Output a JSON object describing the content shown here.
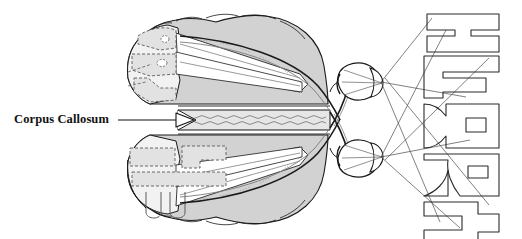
{
  "figure": {
    "title_label": "Corpus Callosum",
    "type": "anatomical-diagram"
  },
  "labels": {
    "corpus_callosum": "Corpus Callosum"
  },
  "stimulus": {
    "word": "HEART",
    "letters": [
      "H",
      "E",
      "A",
      "R",
      "T"
    ],
    "orientation": "rotated-vertical",
    "left_half_letters": [
      "H",
      "E"
    ],
    "right_half_letters": [
      "A",
      "R",
      "T"
    ]
  },
  "cortex_projection": {
    "upper_hemisphere_letters": [
      "A",
      "R"
    ],
    "lower_hemisphere_letters": [
      "H",
      "E"
    ]
  },
  "colors": {
    "brain_fill": "#d2d2d2",
    "brain_fill_light": "#e8e8e8",
    "outline": "#1a1a1a",
    "ray_line": "#555555",
    "dashed_outline": "#666666",
    "background": "#ffffff",
    "text": "#111111"
  },
  "anatomy": {
    "parts": [
      "left hemisphere",
      "right hemisphere",
      "corpus callosum",
      "optic nerve",
      "optic chiasm",
      "optic tract",
      "left eye",
      "right eye",
      "lens",
      "retina"
    ]
  }
}
